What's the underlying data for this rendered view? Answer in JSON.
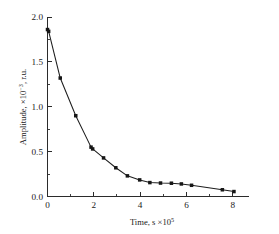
{
  "chart_data": {
    "type": "line",
    "title": "",
    "subtitle": "",
    "xlabel": "Time, s ×10⁵",
    "xlabel_parts": {
      "base": "Time, s ×10",
      "exponent": "5"
    },
    "ylabel": "Amplitude, ×10⁻³, r.u.",
    "ylabel_parts": {
      "base_pre": "Amplitude, ×10",
      "exponent": "−3",
      "base_post": ", r.u."
    },
    "xlim": [
      0,
      8.7
    ],
    "ylim": [
      0.0,
      2.0
    ],
    "xticks": [
      0,
      2,
      4,
      6,
      8
    ],
    "xtick_labels": [
      "0",
      "2",
      "4",
      "6",
      "8"
    ],
    "xticks_minor": [
      1,
      3,
      5,
      7
    ],
    "yticks": [
      0.0,
      0.5,
      1.0,
      1.5,
      2.0
    ],
    "ytick_labels": [
      "0.0",
      "0.5",
      "1.0",
      "1.5",
      "2.0"
    ],
    "yticks_minor": [
      0.25,
      0.75,
      1.25,
      1.75
    ],
    "grid": false,
    "legend": null,
    "marker": "square",
    "marker_color": "#161616",
    "line_color": "#1d1d1d",
    "series": [
      {
        "name": "amplitude-decay",
        "x": [
          0.0,
          0.05,
          0.55,
          1.22,
          1.88,
          1.95,
          2.42,
          2.95,
          3.45,
          3.98,
          4.42,
          4.88,
          5.35,
          5.78,
          6.22,
          7.55,
          8.05
        ],
        "y": [
          1.86,
          1.84,
          1.32,
          0.9,
          0.55,
          0.53,
          0.43,
          0.32,
          0.23,
          0.185,
          0.155,
          0.15,
          0.148,
          0.14,
          0.125,
          0.075,
          0.055
        ]
      }
    ]
  },
  "figure": {
    "background_color": "#ffffff",
    "axis_color": "#2b2b2b"
  }
}
